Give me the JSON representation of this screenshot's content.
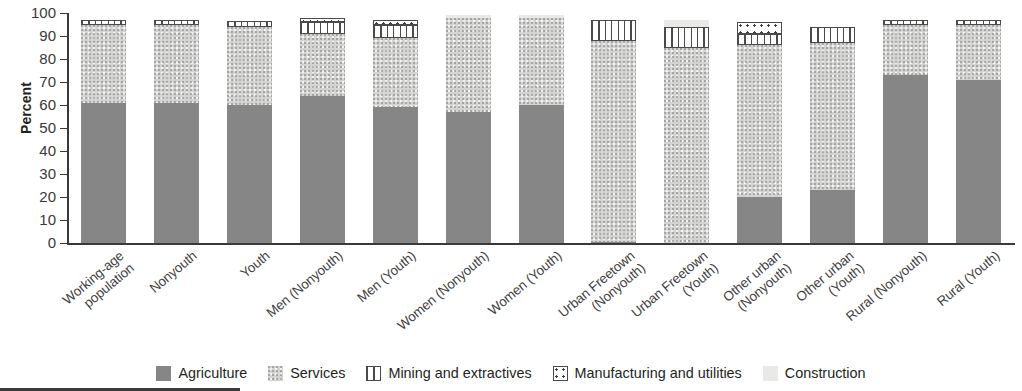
{
  "chart_data": {
    "type": "bar",
    "subtype": "stacked-bar-100-percent",
    "title": "",
    "xlabel": "",
    "ylabel": "Percent",
    "ylim": [
      0,
      100
    ],
    "yticks": [
      0,
      10,
      20,
      30,
      40,
      50,
      60,
      70,
      80,
      90,
      100
    ],
    "grid": false,
    "legend_position": "bottom",
    "categories": [
      "Working-age\npopulation",
      "Nonyouth",
      "Youth",
      "Men (Nonyouth)",
      "Men (Youth)",
      "Women (Nonyouth)",
      "Women (Youth)",
      "Urban Freetown\n(Nonyouth)",
      "Urban Freetown\n(Youth)",
      "Other urban\n(Nonyouth)",
      "Other urban\n(Youth)",
      "Rural (Nonyouth)",
      "Rural (Youth)"
    ],
    "series": [
      {
        "name": "Agriculture",
        "color": "#868686",
        "pattern": "solid-dark-gray",
        "values": [
          61,
          61,
          60,
          64,
          59,
          57,
          60,
          0.5,
          0,
          20,
          23,
          73,
          71
        ]
      },
      {
        "name": "Services",
        "color": "#d4d4d2",
        "pattern": "speckled-medium-gray",
        "values": [
          34,
          34,
          34,
          27,
          30,
          41,
          38,
          87.5,
          85,
          66,
          64,
          22,
          24
        ]
      },
      {
        "name": "Mining and extractives",
        "color": "#ffffff",
        "pattern": "vertical-stripes",
        "values": [
          2,
          2,
          2.5,
          5,
          6,
          0,
          0,
          9,
          9,
          5,
          7,
          2,
          2
        ]
      },
      {
        "name": "Manufacturing and utilities",
        "color": "#ffffff",
        "pattern": "dotted",
        "values": [
          0,
          0,
          0,
          2,
          2,
          0,
          0,
          0,
          0,
          5,
          0,
          0,
          0
        ]
      },
      {
        "name": "Construction",
        "color": "#e9e9e7",
        "pattern": "light-gray",
        "values": [
          0,
          0,
          0,
          0,
          0,
          1,
          1,
          0,
          3,
          0,
          0,
          0,
          0
        ]
      }
    ],
    "legend": [
      {
        "label": "Agriculture",
        "swatch": "agriculture"
      },
      {
        "label": "Services",
        "swatch": "services"
      },
      {
        "label": "Mining and extractives",
        "swatch": "mining"
      },
      {
        "label": "Manufacturing and utilities",
        "swatch": "manufacturing"
      },
      {
        "label": "Construction",
        "swatch": "construction"
      }
    ]
  }
}
